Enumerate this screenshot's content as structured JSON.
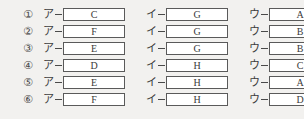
{
  "question": {
    "layout": "six-option-answer-grid",
    "blank_labels": [
      "ア",
      "イ",
      "ウ"
    ],
    "dash_glyph": "—",
    "box_border_color": "#5a5a5a",
    "box_fill_color": "#ffffff",
    "page_background_color": "#f2f1ef",
    "text_color": "#3a3a3a"
  },
  "options": [
    {
      "number": "①",
      "cells": [
        {
          "label": "ア",
          "value": "C"
        },
        {
          "label": "イ",
          "value": "G"
        },
        {
          "label": "ウ",
          "value": "A"
        }
      ]
    },
    {
      "number": "②",
      "cells": [
        {
          "label": "ア",
          "value": "F"
        },
        {
          "label": "イ",
          "value": "G"
        },
        {
          "label": "ウ",
          "value": "B"
        }
      ]
    },
    {
      "number": "③",
      "cells": [
        {
          "label": "ア",
          "value": "E"
        },
        {
          "label": "イ",
          "value": "G"
        },
        {
          "label": "ウ",
          "value": "B"
        }
      ]
    },
    {
      "number": "④",
      "cells": [
        {
          "label": "ア",
          "value": "D"
        },
        {
          "label": "イ",
          "value": "H"
        },
        {
          "label": "ウ",
          "value": "C"
        }
      ]
    },
    {
      "number": "⑤",
      "cells": [
        {
          "label": "ア",
          "value": "E"
        },
        {
          "label": "イ",
          "value": "H"
        },
        {
          "label": "ウ",
          "value": "A"
        }
      ]
    },
    {
      "number": "⑥",
      "cells": [
        {
          "label": "ア",
          "value": "F"
        },
        {
          "label": "イ",
          "value": "H"
        },
        {
          "label": "ウ",
          "value": "D"
        }
      ]
    }
  ]
}
